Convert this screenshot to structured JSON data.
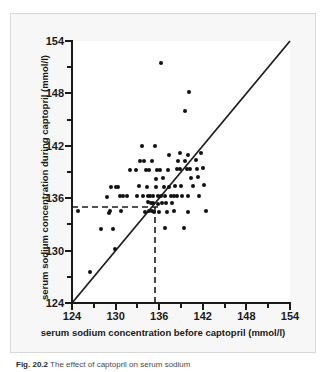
{
  "figure": {
    "caption_label": "Fig. 20.2",
    "caption_text": "The effect of captopril on serum sodium",
    "background_color": "#f7f7f7",
    "marker_color": "#111111",
    "line_color": "#1a1a1a"
  },
  "chart_data": {
    "type": "scatter",
    "title": "",
    "xlabel": "serum sodium concentration before captopril (mmol/l)",
    "ylabel": "serum sodium concentration during captopril (mmol/l)",
    "xlim": [
      124,
      154
    ],
    "ylim": [
      124,
      154
    ],
    "xticks": [
      124,
      130,
      136,
      142,
      148,
      154
    ],
    "yticks": [
      124,
      130,
      136,
      142,
      148,
      154
    ],
    "xtick_labels": [
      "124",
      "130",
      "136",
      "142",
      "148",
      "154"
    ],
    "ytick_labels": [
      "124",
      "130",
      "136",
      "142",
      "148",
      "154"
    ],
    "minor_tick_step": 3,
    "grid": false,
    "legend": null,
    "reference_lines": [
      {
        "name": "identity-line",
        "style": "solid",
        "description": "line of equality y = x",
        "from": [
          124,
          124
        ],
        "to": [
          154,
          154
        ]
      },
      {
        "name": "mean-during-captopril",
        "style": "dashed",
        "orientation": "horizontal",
        "value": 134.5
      },
      {
        "name": "mean-before-captopril",
        "style": "dashed",
        "orientation": "vertical",
        "value": 135.2
      }
    ],
    "points": [
      [
        126.5,
        127.5
      ],
      [
        124.8,
        134.5
      ],
      [
        128.0,
        132.5
      ],
      [
        128.8,
        136.1
      ],
      [
        129.1,
        134.3
      ],
      [
        129.3,
        137.3
      ],
      [
        129.2,
        134.5
      ],
      [
        130.0,
        137.3
      ],
      [
        130.3,
        137.3
      ],
      [
        129.6,
        132.5
      ],
      [
        129.9,
        130.2
      ],
      [
        130.6,
        136.2
      ],
      [
        131.0,
        136.2
      ],
      [
        132.8,
        139.2
      ],
      [
        133.0,
        136.3
      ],
      [
        133.2,
        137.4
      ],
      [
        133.6,
        142.0
      ],
      [
        133.9,
        140.3
      ],
      [
        134.2,
        139.2
      ],
      [
        134.6,
        139.2
      ],
      [
        134.3,
        137.3
      ],
      [
        134.4,
        136.2
      ],
      [
        134.5,
        135.6
      ],
      [
        134.6,
        134.5
      ],
      [
        134.8,
        136.2
      ],
      [
        134.9,
        135.5
      ],
      [
        135.0,
        134.5
      ],
      [
        135.1,
        136.2
      ],
      [
        135.2,
        135.4
      ],
      [
        135.3,
        134.4
      ],
      [
        135.0,
        140.3
      ],
      [
        135.4,
        142.0
      ],
      [
        135.6,
        138.2
      ],
      [
        135.8,
        136.3
      ],
      [
        135.9,
        135.3
      ],
      [
        136.0,
        134.4
      ],
      [
        136.2,
        136.2
      ],
      [
        136.4,
        135.4
      ],
      [
        136.6,
        137.3
      ],
      [
        136.8,
        136.2
      ],
      [
        137.0,
        135.4
      ],
      [
        136.3,
        151.5
      ],
      [
        137.2,
        139.2
      ],
      [
        137.4,
        137.3
      ],
      [
        137.6,
        136.3
      ],
      [
        137.8,
        135.4
      ],
      [
        138.0,
        134.5
      ],
      [
        138.2,
        137.4
      ],
      [
        138.4,
        139.3
      ],
      [
        138.6,
        140.3
      ],
      [
        138.8,
        139.3
      ],
      [
        139.0,
        137.4
      ],
      [
        139.2,
        136.3
      ],
      [
        139.4,
        132.6
      ],
      [
        136.8,
        132.6
      ],
      [
        137.1,
        134.4
      ],
      [
        139.6,
        140.3
      ],
      [
        139.8,
        139.3
      ],
      [
        140.0,
        141.0
      ],
      [
        140.2,
        139.4
      ],
      [
        140.4,
        138.3
      ],
      [
        140.6,
        137.4
      ],
      [
        140.1,
        148.2
      ],
      [
        139.6,
        146.0
      ],
      [
        141.0,
        140.4
      ],
      [
        141.2,
        139.4
      ],
      [
        141.4,
        138.4
      ],
      [
        141.5,
        136.3
      ],
      [
        141.8,
        141.2
      ],
      [
        142.0,
        139.5
      ],
      [
        142.2,
        137.5
      ],
      [
        142.4,
        134.5
      ],
      [
        140.0,
        134.4
      ],
      [
        138.5,
        136.3
      ],
      [
        135.7,
        139.2
      ],
      [
        133.4,
        140.3
      ],
      [
        132.0,
        139.2
      ],
      [
        131.5,
        136.2
      ],
      [
        130.8,
        134.5
      ],
      [
        133.8,
        136.2
      ],
      [
        136.5,
        138.3
      ],
      [
        137.3,
        141.0
      ],
      [
        138.9,
        141.2
      ],
      [
        139.9,
        136.3
      ],
      [
        136.1,
        139.2
      ],
      [
        134.0,
        134.4
      ],
      [
        135.5,
        137.3
      ],
      [
        138.1,
        136.2
      ]
    ]
  }
}
